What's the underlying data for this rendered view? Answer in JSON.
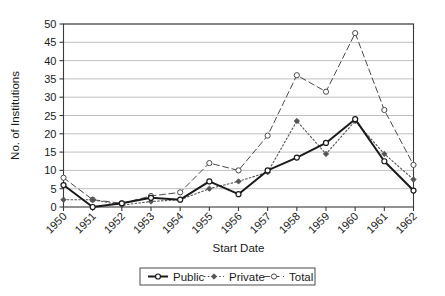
{
  "chart_data": {
    "type": "line",
    "title": "",
    "xlabel": "Start Date",
    "ylabel": "No. of Institutions",
    "categories": [
      "1950",
      "1951",
      "1952",
      "1953",
      "1954",
      "1955",
      "1956",
      "1957",
      "1958",
      "1959",
      "1960",
      "1961",
      "1962"
    ],
    "x": [
      1950,
      1951,
      1952,
      1953,
      1954,
      1955,
      1956,
      1957,
      1958,
      1959,
      1960,
      1961,
      1962
    ],
    "series": [
      {
        "name": "Public",
        "values": [
          6,
          0,
          1,
          2.5,
          2,
          7,
          3.5,
          10,
          13.5,
          17.5,
          24,
          12.5,
          4.5
        ],
        "line_style": "solid",
        "marker": "open-square-circle",
        "color": "#1a1a1a"
      },
      {
        "name": "Private",
        "values": [
          2,
          2,
          0.5,
          1.5,
          2,
          5,
          7,
          9.5,
          23.5,
          14.5,
          23.5,
          14.5,
          7.5
        ],
        "line_style": "dotted",
        "marker": "filled-diamond",
        "color": "#555555"
      },
      {
        "name": "Total",
        "values": [
          8,
          2,
          1,
          3,
          4,
          12,
          10,
          19.5,
          36,
          31.5,
          47.5,
          26.5,
          11.5
        ],
        "line_style": "dashed",
        "marker": "open-circle",
        "color": "#4a4a4a"
      }
    ],
    "ylim": [
      0,
      50
    ],
    "yticks": [
      0,
      5,
      10,
      15,
      20,
      25,
      30,
      35,
      40,
      45,
      50
    ],
    "ytick_labels": [
      "0",
      "5",
      "10",
      "15",
      "20",
      "25",
      "30",
      "35",
      "40",
      "45",
      "50"
    ],
    "grid": true,
    "grid_axis": "y",
    "legend_position": "bottom",
    "xtick_rotation": 45
  },
  "legend": {
    "entries": [
      {
        "label": "Public"
      },
      {
        "label": "Private"
      },
      {
        "label": "Total"
      }
    ]
  }
}
